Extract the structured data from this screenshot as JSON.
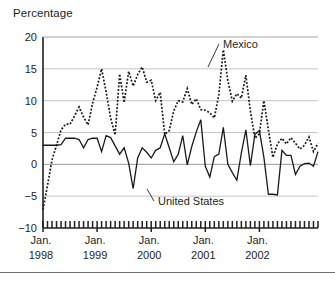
{
  "chart_data": {
    "type": "line",
    "title": "Percentage",
    "xlabel": "",
    "ylabel": "Percentage",
    "ylim": [
      -10,
      20
    ],
    "yticks": [
      20,
      15,
      10,
      5,
      0,
      -5,
      -10
    ],
    "ytick_labels": [
      "20",
      "15",
      "10",
      "5",
      "0",
      "−5",
      "−10"
    ],
    "grid": true,
    "legend_position": "inline-annotations",
    "x_major_labels": [
      {
        "line1": "Jan.",
        "line2": "1998",
        "index": 0
      },
      {
        "line1": "Jan.",
        "line2": "1999",
        "index": 12
      },
      {
        "line1": "Jan.",
        "line2": "2000",
        "index": 24
      },
      {
        "line1": "Jan.",
        "line2": "2001",
        "index": 36
      },
      {
        "line1": "Jan.",
        "line2": "2002",
        "index": 48
      }
    ],
    "x_tick_count": 62,
    "x_tick_interval": "monthly",
    "annotations": [
      {
        "text": "Mexico",
        "series": "Mexico",
        "x_px": 223,
        "y_px": 48,
        "leader_to_x_px": 208,
        "leader_to_y_px": 67
      },
      {
        "text": "United States",
        "series": "United States",
        "x_px": 158,
        "y_px": 205,
        "leader_to_x_px": 147,
        "leader_to_y_px": 189
      }
    ],
    "series": [
      {
        "name": "Mexico",
        "style": "dotted",
        "color": "#1a1a1a",
        "values": [
          -7.1,
          -3.3,
          0.7,
          3.0,
          5.4,
          6.3,
          6.3,
          7.6,
          9.0,
          7.4,
          6.2,
          9.6,
          12.1,
          15.0,
          11.4,
          7.3,
          4.6,
          14.2,
          9.7,
          14.6,
          12.3,
          14.1,
          15.3,
          12.9,
          13.2,
          10.0,
          11.3,
          4.7,
          5.3,
          8.4,
          10.0,
          9.8,
          11.9,
          9.4,
          10.3,
          8.6,
          8.5,
          8.1,
          7.3,
          10.9,
          18.0,
          13.2,
          9.9,
          11.1,
          10.4,
          14.0,
          8.4,
          4.1,
          4.8,
          10.0,
          5.4,
          1.1,
          3.2,
          4.1,
          3.2,
          4.2,
          3.3,
          2.4,
          3.0,
          4.3,
          2.0,
          3.3
        ]
      },
      {
        "name": "United States",
        "style": "solid",
        "color": "#1a1a1a",
        "values": [
          3.0,
          3.0,
          3.0,
          3.0,
          3.1,
          4.1,
          4.1,
          4.1,
          3.9,
          2.6,
          3.9,
          4.1,
          4.1,
          2.0,
          4.5,
          4.2,
          2.9,
          1.6,
          2.6,
          0.2,
          -3.8,
          1.0,
          2.6,
          1.9,
          1.0,
          2.2,
          2.6,
          4.8,
          2.6,
          0.4,
          1.6,
          4.5,
          -0.1,
          2.8,
          5.1,
          7.0,
          -0.3,
          -2.0,
          1.2,
          1.6,
          5.8,
          0.0,
          -1.3,
          -2.5,
          1.8,
          5.4,
          -0.2,
          4.7,
          5.3,
          1.1,
          -4.7,
          -4.7,
          -4.8,
          2.2,
          1.4,
          1.4,
          -1.6,
          -0.3,
          0.1,
          0.2,
          -0.3,
          2.0
        ]
      }
    ]
  },
  "figure": {
    "plot_left_px": 43,
    "plot_right_px": 318,
    "plot_top_px": 37,
    "plot_bottom_px": 228
  }
}
